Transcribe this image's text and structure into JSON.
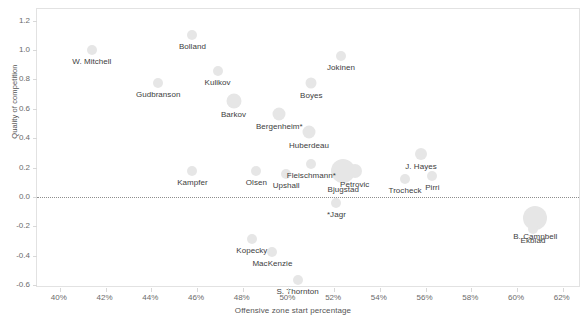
{
  "chart_data": {
    "type": "scatter",
    "title": "",
    "subtitle": "",
    "xlabel": "Offensive zone start percentage",
    "ylabel": "Quality of competition",
    "xlim": [
      39.0,
      62.8
    ],
    "ylim": [
      -0.62,
      1.28
    ],
    "grid": false,
    "legend": null,
    "x_tick_labels": [
      "40%",
      "42%",
      "44%",
      "46%",
      "48%",
      "50%",
      "52%",
      "54%",
      "56%",
      "58%",
      "60%",
      "62%"
    ],
    "x_tick_values": [
      40,
      42,
      44,
      46,
      48,
      50,
      52,
      54,
      56,
      58,
      60,
      62
    ],
    "y_tick_labels": [
      "1.2",
      "1.0",
      "0.8",
      "0.6",
      "0.4",
      "0.2",
      "0.0",
      "-0.2",
      "-0.4",
      "-0.6"
    ],
    "y_tick_values": [
      1.2,
      1.0,
      0.8,
      0.6,
      0.4,
      0.2,
      0.0,
      -0.2,
      -0.4,
      -0.6
    ],
    "annotations": [
      {
        "text": "zero reference line",
        "y": 0.0
      }
    ],
    "marker_color": "#e6e6e6",
    "points": [
      {
        "label": "Bolland",
        "x": 45.8,
        "y": 1.1,
        "size": 10,
        "label_dx": 0,
        "label_dy": 0
      },
      {
        "label": "W. Mitchell",
        "x": 41.4,
        "y": 1.0,
        "size": 10,
        "label_dx": 0,
        "label_dy": 0
      },
      {
        "label": "Jokinen",
        "x": 52.3,
        "y": 0.96,
        "size": 10,
        "label_dx": 0,
        "label_dy": 0
      },
      {
        "label": "Kulikov",
        "x": 46.9,
        "y": 0.855,
        "size": 10,
        "label_dx": 0,
        "label_dy": 0
      },
      {
        "label": "Boyes",
        "x": 51.0,
        "y": 0.775,
        "size": 11,
        "label_dx": 0,
        "label_dy": 0
      },
      {
        "label": "Gudbranson",
        "x": 44.3,
        "y": 0.775,
        "size": 10,
        "label_dx": 0,
        "label_dy": 0
      },
      {
        "label": "Barkov",
        "x": 47.6,
        "y": 0.655,
        "size": 15,
        "label_dx": 0,
        "label_dy": 0
      },
      {
        "label": "Bergenheim*",
        "x": 49.6,
        "y": 0.565,
        "size": 13,
        "label_dx": 0,
        "label_dy": 0
      },
      {
        "label": "Huberdeau",
        "x": 50.9,
        "y": 0.44,
        "size": 13,
        "label_dx": 0,
        "label_dy": 0
      },
      {
        "label": "J. Hayes",
        "x": 55.8,
        "y": 0.295,
        "size": 12,
        "label_dx": 0,
        "label_dy": 0
      },
      {
        "label": "Fleischmann*",
        "x": 51.0,
        "y": 0.225,
        "size": 10,
        "label_dx": 0,
        "label_dy": 0
      },
      {
        "label": "Kampfer",
        "x": 45.8,
        "y": 0.175,
        "size": 10,
        "label_dx": 0,
        "label_dy": 0
      },
      {
        "label": "Olsen",
        "x": 48.6,
        "y": 0.175,
        "size": 10,
        "label_dx": 0,
        "label_dy": 0
      },
      {
        "label": "Upshall",
        "x": 49.9,
        "y": 0.155,
        "size": 10,
        "label_dx": 0,
        "label_dy": 0
      },
      {
        "label": "Bjugstad",
        "x": 52.4,
        "y": 0.175,
        "size": 24,
        "label_dx": 0,
        "label_dy": 0
      },
      {
        "label": "Petrovic",
        "x": 52.9,
        "y": 0.175,
        "size": 14,
        "label_dx": 0,
        "label_dy": 0
      },
      {
        "label": "Pirri",
        "x": 56.3,
        "y": 0.145,
        "size": 10,
        "label_dx": 0,
        "label_dy": 0
      },
      {
        "label": "Trocheck",
        "x": 55.1,
        "y": 0.125,
        "size": 10,
        "label_dx": 0,
        "label_dy": 0
      },
      {
        "label": "*Jagr",
        "x": 52.1,
        "y": -0.04,
        "size": 10,
        "label_dx": 0,
        "label_dy": 0
      },
      {
        "label": "B. Campbell",
        "x": 60.8,
        "y": -0.14,
        "size": 24,
        "label_dx": 0,
        "label_dy": 0
      },
      {
        "label": "Ekblad",
        "x": 60.7,
        "y": -0.215,
        "size": 10,
        "label_dx": 0,
        "label_dy": 0
      },
      {
        "label": "Kopecky",
        "x": 48.4,
        "y": -0.285,
        "size": 10,
        "label_dx": 0,
        "label_dy": 0
      },
      {
        "label": "MacKenzie",
        "x": 49.3,
        "y": -0.375,
        "size": 10,
        "label_dx": 0,
        "label_dy": 0
      },
      {
        "label": "S. Thornton",
        "x": 50.4,
        "y": -0.565,
        "size": 10,
        "label_dx": 0,
        "label_dy": 0
      }
    ]
  }
}
